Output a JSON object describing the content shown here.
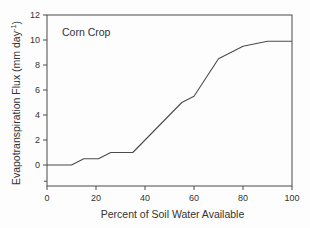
{
  "chart_data": {
    "type": "line",
    "title": "Corn Crop",
    "xlabel": "Percent of Soil Water Available",
    "ylabel_pre": "Evapotranspiration Flux (mm day",
    "ylabel_sup": "-1",
    "ylabel_post": ")",
    "xlim": [
      0,
      100
    ],
    "ylim": [
      -1.68,
      12
    ],
    "xticks": [
      0,
      20,
      40,
      60,
      80,
      100
    ],
    "yticks": [
      0,
      2,
      4,
      6,
      8,
      10,
      12
    ],
    "extra_y_minor_tick": -1.3,
    "grid": false,
    "legend": "none",
    "series": [
      {
        "name": "evapotranspiration-flux",
        "points": [
          [
            0,
            0
          ],
          [
            10,
            0
          ],
          [
            15,
            0.5
          ],
          [
            21,
            0.5
          ],
          [
            26,
            1
          ],
          [
            35,
            1
          ],
          [
            55,
            5
          ],
          [
            60,
            5.5
          ],
          [
            70,
            8.5
          ],
          [
            80,
            9.5
          ],
          [
            90,
            9.9
          ],
          [
            100,
            9.9
          ]
        ]
      }
    ],
    "line_color": "#4b4b4b",
    "axis_color": "#4b4b4b",
    "text_color": "#333333",
    "background": "#fdfdfd"
  }
}
